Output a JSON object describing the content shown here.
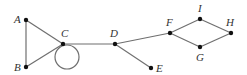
{
  "diagram": {
    "type": "graph",
    "nodes": [
      {
        "id": "A",
        "label": "A",
        "x": 26,
        "y": 20,
        "lx": 14,
        "ly": 23
      },
      {
        "id": "B",
        "label": "B",
        "x": 26,
        "y": 67,
        "lx": 14,
        "ly": 71
      },
      {
        "id": "C",
        "label": "C",
        "x": 63,
        "y": 44,
        "lx": 61,
        "ly": 37
      },
      {
        "id": "D",
        "label": "D",
        "x": 115,
        "y": 44,
        "lx": 110,
        "ly": 37
      },
      {
        "id": "E",
        "label": "E",
        "x": 151,
        "y": 68,
        "lx": 156,
        "ly": 72
      },
      {
        "id": "F",
        "label": "F",
        "x": 170,
        "y": 33,
        "lx": 166,
        "ly": 26
      },
      {
        "id": "I",
        "label": "I",
        "x": 200,
        "y": 19,
        "lx": 198,
        "ly": 12
      },
      {
        "id": "H",
        "label": "H",
        "x": 231,
        "y": 33,
        "lx": 226,
        "ly": 26
      },
      {
        "id": "G",
        "label": "G",
        "x": 200,
        "y": 47,
        "lx": 196,
        "ly": 61
      }
    ],
    "edges": [
      [
        "A",
        "B"
      ],
      [
        "A",
        "C"
      ],
      [
        "B",
        "C"
      ],
      [
        "C",
        "D"
      ],
      [
        "D",
        "E"
      ],
      [
        "D",
        "F"
      ],
      [
        "F",
        "I"
      ],
      [
        "I",
        "H"
      ],
      [
        "H",
        "G"
      ],
      [
        "G",
        "F"
      ]
    ],
    "loops": [
      {
        "node": "C",
        "cx": 67,
        "cy": 57,
        "r": 12
      }
    ]
  }
}
